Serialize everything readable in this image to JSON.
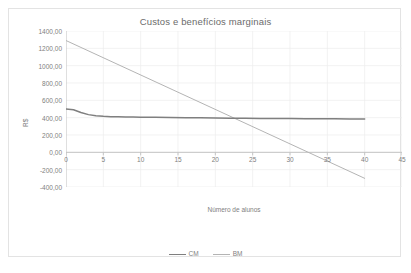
{
  "chart_data": {
    "type": "line",
    "title": "Custos e benefícios marginais",
    "xlabel": "Número de alunos",
    "ylabel": "R$",
    "xlim": [
      0,
      45
    ],
    "ylim": [
      -400,
      1400
    ],
    "grid": true,
    "legend_position": "bottom",
    "xticks": [
      "0",
      "5",
      "10",
      "15",
      "20",
      "25",
      "30",
      "35",
      "40",
      "45"
    ],
    "xtick_values": [
      0,
      5,
      10,
      15,
      20,
      25,
      30,
      35,
      40,
      45
    ],
    "yticks": [
      "1400,00",
      "1200,00",
      "1000,00",
      "800,00",
      "600,00",
      "400,00",
      "200,00",
      "0,00",
      "-200,00",
      "-400,00"
    ],
    "ytick_values": [
      1400,
      1200,
      1000,
      800,
      600,
      400,
      200,
      0,
      -200,
      -400
    ],
    "series": [
      {
        "name": "CM",
        "color": "#7f7f7f",
        "width": 1.5,
        "x": [
          0,
          1,
          2,
          3,
          4,
          5,
          6,
          7,
          8,
          9,
          10,
          12,
          14,
          16,
          18,
          20,
          22,
          24,
          26,
          28,
          30,
          32,
          34,
          36,
          38,
          40
        ],
        "values": [
          500,
          492,
          460,
          435,
          422,
          415,
          412,
          410,
          408,
          407,
          406,
          404,
          402,
          400,
          398,
          396,
          394,
          392,
          391,
          390,
          389,
          388,
          387,
          387,
          386,
          386
        ]
      },
      {
        "name": "BM",
        "color": "#b4b4b4",
        "width": 1.0,
        "x": [
          0,
          40
        ],
        "values": [
          1290,
          -300
        ]
      }
    ],
    "legend": [
      {
        "label": "CM",
        "color": "#7f7f7f"
      },
      {
        "label": "BM",
        "color": "#b4b4b4"
      }
    ],
    "intersection": {
      "x": 23,
      "y": 390
    }
  }
}
